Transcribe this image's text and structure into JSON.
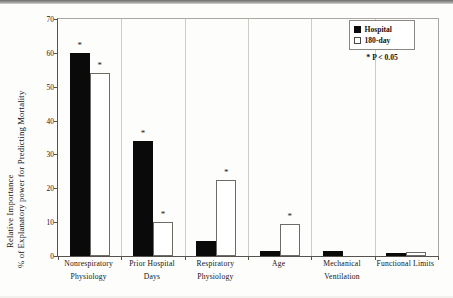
{
  "chart_data": {
    "type": "bar",
    "title": "",
    "subtitle": "",
    "xlabel": "",
    "ylabel_line1": "Relative Importance",
    "ylabel_line2": "% of Explanatory power for Predicting Mortality",
    "ylim": [
      0,
      70
    ],
    "yticks": [
      0,
      10,
      20,
      30,
      40,
      50,
      60,
      70
    ],
    "ytick_labels": [
      "0",
      "10",
      "20",
      "30",
      "40",
      "50",
      "60",
      "70"
    ],
    "grid": false,
    "legend_position": "top-right",
    "categories": [
      "Nonrespiratory Physiology",
      "Prior Hospital Days",
      "Respiratory Physiology",
      "Age",
      "Mechanical Ventilation",
      "Functional Limits"
    ],
    "category_lines": [
      [
        "Nonrespiratory",
        "Physiology"
      ],
      [
        "Prior Hospital",
        "Days"
      ],
      [
        "Respiratory",
        "Physiology"
      ],
      [
        "Age",
        ""
      ],
      [
        "Mechanical",
        "Ventilation"
      ],
      [
        "Functional Limits",
        ""
      ]
    ],
    "series": [
      {
        "name": "Hospital",
        "color": "#0a0a0a",
        "values": [
          60.0,
          34.0,
          4.3,
          1.5,
          1.5,
          0.8
        ],
        "significant": [
          true,
          true,
          false,
          false,
          false,
          false
        ]
      },
      {
        "name": "180-day",
        "color": "#ffffff",
        "values": [
          54.0,
          10.0,
          22.5,
          9.5,
          0.0,
          1.2
        ],
        "significant": [
          true,
          true,
          true,
          true,
          false,
          false
        ]
      }
    ],
    "annotations": {
      "significance_marker": "*",
      "significance_note": "P < 0.05"
    }
  },
  "legend": {
    "items": [
      {
        "label": "Hospital",
        "swatch": "filled-square"
      },
      {
        "label": "180-day",
        "swatch": "open-square"
      }
    ],
    "note_star": "*",
    "note_text": "P < 0.05"
  }
}
